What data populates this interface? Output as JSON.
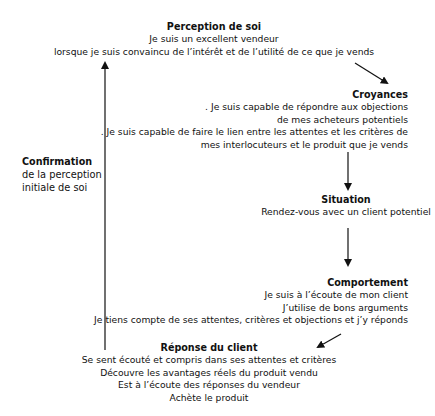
{
  "diagram": {
    "perception": {
      "title": "Perception de soi",
      "lines": [
        "Je suis un excellent vendeur",
        "lorsque je suis convaincu de l’intérêt et de l’utilité de ce que je vends"
      ]
    },
    "croyances": {
      "title": "Croyances",
      "lines": [
        ". Je suis capable de répondre aux objections",
        "de mes acheteurs potentiels",
        ". Je suis capable de faire le lien entre les attentes et les critères de",
        "mes interlocuteurs et le produit que je vends"
      ]
    },
    "situation": {
      "title": "Situation",
      "lines": [
        "Rendez-vous avec un client potentiel"
      ]
    },
    "comportement": {
      "title": "Comportement",
      "lines": [
        "Je suis à l’écoute de mon client",
        "J’utilise de bons arguments",
        "Je tiens compte de ses attentes, critères et objections et j’y réponds"
      ]
    },
    "reponse": {
      "title": "Réponse du client",
      "lines": [
        "Se sent écouté et compris dans ses attentes et critères",
        "Découvre les avantages réels du produit vendu",
        "Est à l’écoute des réponses du vendeur",
        "Achète le produit"
      ]
    },
    "confirmation": {
      "title": "Confirmation",
      "lines": [
        "de la perception",
        "initiale de soi"
      ]
    },
    "colors": {
      "text": "#111111",
      "arrow": "#111111",
      "background": "#ffffff"
    }
  }
}
